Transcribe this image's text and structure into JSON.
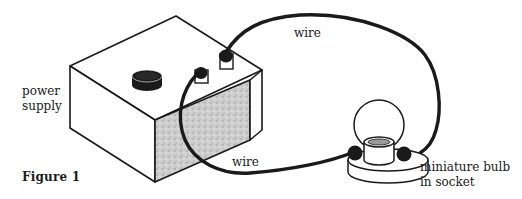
{
  "diagram": {
    "caption": "Figure 1",
    "labels": {
      "power_supply_line1": "power",
      "power_supply_line2": "supply",
      "wire_top": "wire",
      "wire_bottom": "wire",
      "bulb_line1": "miniature bulb",
      "bulb_line2": "in socket"
    },
    "components": [
      "power supply",
      "wire",
      "wire",
      "miniature bulb in socket"
    ],
    "colors": {
      "ink": "#1a1a1a",
      "background": "#ffffff",
      "speckle_fill": "#c8c8c8"
    }
  }
}
